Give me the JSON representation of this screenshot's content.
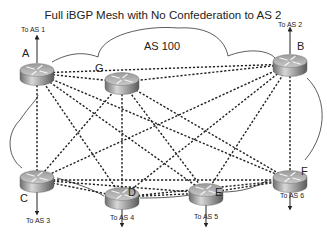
{
  "title": "Full iBGP Mesh with No Confederation to AS 2",
  "as_label": "AS 100",
  "routers": [
    {
      "id": "A",
      "label": "A",
      "x": 37,
      "y": 70,
      "external": "To AS 1",
      "ext_dir": "up"
    },
    {
      "id": "B",
      "label": "B",
      "x": 290,
      "y": 61,
      "external": "To AS 2",
      "ext_dir": "up"
    },
    {
      "id": "G",
      "label": "G",
      "x": 122,
      "y": 79,
      "external": null
    },
    {
      "id": "C",
      "label": "C",
      "x": 37,
      "y": 177,
      "external": "To AS 3",
      "ext_dir": "down"
    },
    {
      "id": "D",
      "label": "D",
      "x": 122,
      "y": 194,
      "external": "To AS 4",
      "ext_dir": "down"
    },
    {
      "id": "E",
      "label": "E",
      "x": 206,
      "y": 190,
      "external": "To AS 5",
      "ext_dir": "down"
    },
    {
      "id": "F",
      "label": "F",
      "x": 290,
      "y": 177,
      "external": "To AS 6",
      "ext_dir": "down"
    }
  ],
  "links": [
    [
      "A",
      "B"
    ],
    [
      "A",
      "G"
    ],
    [
      "A",
      "C"
    ],
    [
      "A",
      "D"
    ],
    [
      "A",
      "E"
    ],
    [
      "A",
      "F"
    ],
    [
      "B",
      "G"
    ],
    [
      "B",
      "C"
    ],
    [
      "B",
      "D"
    ],
    [
      "B",
      "E"
    ],
    [
      "B",
      "F"
    ],
    [
      "G",
      "C"
    ],
    [
      "G",
      "D"
    ],
    [
      "G",
      "E"
    ],
    [
      "G",
      "F"
    ],
    [
      "C",
      "D"
    ],
    [
      "C",
      "E"
    ],
    [
      "C",
      "F"
    ],
    [
      "D",
      "E"
    ],
    [
      "D",
      "F"
    ],
    [
      "E",
      "F"
    ]
  ],
  "labels": {
    "A": "A",
    "B": "B",
    "C": "C",
    "D": "D",
    "E": "E",
    "F": "F",
    "G": "G",
    "to_as1": "To AS 1",
    "to_as2": "To AS 2",
    "to_as3": "To AS 3",
    "to_as4": "To AS 4",
    "to_as5": "To AS 5",
    "to_as6": "To AS 6"
  }
}
